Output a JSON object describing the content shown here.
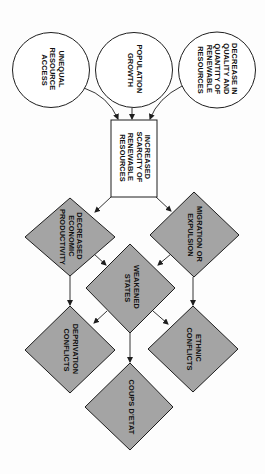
{
  "diagram": {
    "type": "flowchart",
    "orientation": "rotated 90 degrees clockwise (reads top-to-bottom)",
    "colors": {
      "stroke": "#1e1e1e",
      "diamond_fill": "#a4a4a4",
      "box_fill": "#ffffff",
      "background": "#fdfdfd"
    },
    "nodes": {
      "unequal_access": {
        "shape": "circle",
        "lines": [
          "UNEQUAL",
          "RESOURCE",
          "ACCESS"
        ]
      },
      "population_growth": {
        "shape": "circle",
        "lines": [
          "POPULATION",
          "GROWTH"
        ]
      },
      "decrease_resources": {
        "shape": "circle",
        "lines": [
          "DECREASE IN",
          "QUALITY AND",
          "QUANTITY OF",
          "RENEWABLE",
          "RESOURCES"
        ]
      },
      "increased_scarcity": {
        "shape": "rectangle",
        "lines": [
          "INCREASED",
          "SCARCITY OF",
          "RENEWABLE",
          "RESOURCES"
        ]
      },
      "decreased_productivity": {
        "shape": "diamond",
        "lines": [
          "DECREASED",
          "ECONOMIC",
          "PRODUCTIVITY"
        ]
      },
      "migration": {
        "shape": "diamond",
        "lines": [
          "MIGRATION OR",
          "EXPULSION"
        ]
      },
      "weakened_states": {
        "shape": "diamond",
        "lines": [
          "WEAKENED",
          "STATES"
        ]
      },
      "deprivation_conflicts": {
        "shape": "diamond",
        "lines": [
          "DEPRIVATION",
          "CONFLICTS"
        ]
      },
      "ethnic_conflicts": {
        "shape": "diamond",
        "lines": [
          "ETHNIC",
          "CONFLICTS"
        ]
      },
      "coups": {
        "shape": "diamond",
        "lines": [
          "COUPS D'ETAT"
        ]
      }
    },
    "edges": [
      {
        "from": "unequal_access",
        "to": "increased_scarcity"
      },
      {
        "from": "population_growth",
        "to": "increased_scarcity"
      },
      {
        "from": "decrease_resources",
        "to": "increased_scarcity"
      },
      {
        "from": "increased_scarcity",
        "to": "decreased_productivity"
      },
      {
        "from": "increased_scarcity",
        "to": "migration"
      },
      {
        "from": "decreased_productivity",
        "to": "weakened_states"
      },
      {
        "from": "migration",
        "to": "weakened_states"
      },
      {
        "from": "decreased_productivity",
        "to": "deprivation_conflicts"
      },
      {
        "from": "migration",
        "to": "ethnic_conflicts"
      },
      {
        "from": "weakened_states",
        "to": "deprivation_conflicts"
      },
      {
        "from": "weakened_states",
        "to": "ethnic_conflicts"
      },
      {
        "from": "weakened_states",
        "to": "coups"
      }
    ]
  }
}
